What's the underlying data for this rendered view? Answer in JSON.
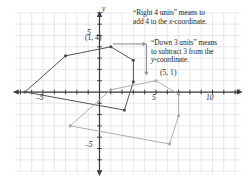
{
  "figure": {
    "type": "coordinate-plane-translation-diagram",
    "background": "#ffffff",
    "grid_color": "#d8d8dc",
    "axis_color": "#3b3b3f",
    "original_color": "#4a4a4f",
    "image_color": "#a9a9b0"
  },
  "axes": {
    "x_label": "x",
    "y_label": "y",
    "x_ticks": [
      {
        "value": -5,
        "label": "–5"
      },
      {
        "value": 5,
        "label": "5"
      },
      {
        "value": 10,
        "label": "10"
      }
    ],
    "y_ticks": [
      {
        "value": 5,
        "label": "5"
      },
      {
        "value": -5,
        "label": "–5"
      }
    ],
    "xlim": [
      -7.5,
      12.5
    ],
    "ylim": [
      -7.2,
      7.0
    ],
    "grid": true,
    "grid_step": 1
  },
  "annotations": {
    "note_right": {
      "line1": "“Right 4 units” means to",
      "line2_a": "add 4 to the ",
      "line2_italic": "x",
      "line2_b": "-coordinate."
    },
    "note_down": {
      "line1": "“Down 3 units” means",
      "line2": "to subtract 3 from the",
      "line3_italic": "y",
      "line3_b": "-coordinate."
    }
  },
  "point_labels": [
    {
      "name": "original-vertex-label",
      "text": "(1, 4)",
      "x": 1,
      "y": 4
    },
    {
      "name": "image-vertex-label",
      "text": "(5, 1)",
      "x": 5,
      "y": 1
    }
  ],
  "chart_data": {
    "type": "scatter",
    "title": "",
    "xlabel": "x",
    "ylabel": "y",
    "xlim": [
      -7.5,
      12.5
    ],
    "ylim": [
      -7.2,
      7.0
    ],
    "grid": true,
    "series": [
      {
        "name": "Original figure",
        "color": "#4a4a4f",
        "closed": true,
        "marked_vertices": [
          [
            -6.6,
            0
          ],
          [
            -3.0,
            3.2
          ],
          [
            1,
            4
          ],
          [
            3.0,
            2.8
          ],
          [
            3.0,
            0.9
          ],
          [
            2.2,
            -1.6
          ]
        ],
        "points": [
          [
            -6.6,
            0
          ],
          [
            -3.0,
            3.2
          ],
          [
            1,
            4
          ],
          [
            3.0,
            2.8
          ],
          [
            3.0,
            0.9
          ],
          [
            2.2,
            -1.6
          ]
        ]
      },
      {
        "name": "Translated image",
        "color": "#a9a9b0",
        "closed": true,
        "marked_vertices": [
          [
            -2.6,
            -3
          ],
          [
            1.0,
            0.2
          ],
          [
            5,
            1
          ],
          [
            7.0,
            -0.2
          ],
          [
            7.0,
            -2.1
          ],
          [
            6.2,
            -4.6
          ]
        ],
        "points": [
          [
            -2.6,
            -3
          ],
          [
            1.0,
            0.2
          ],
          [
            5,
            1
          ],
          [
            7.0,
            -0.2
          ],
          [
            7.0,
            -2.1
          ],
          [
            6.2,
            -4.6
          ]
        ]
      }
    ],
    "translation": {
      "dx": 4,
      "dy": -3,
      "description": "Right 4 units, Down 3 units"
    },
    "arrows": [
      {
        "name": "right-arrow",
        "from": [
          1.2,
          4.25
        ],
        "to": [
          4.15,
          4.25
        ],
        "direction": "right"
      },
      {
        "name": "down-arrow",
        "from": [
          4.15,
          4.25
        ],
        "to": [
          4.15,
          1.45
        ],
        "direction": "down"
      }
    ]
  }
}
